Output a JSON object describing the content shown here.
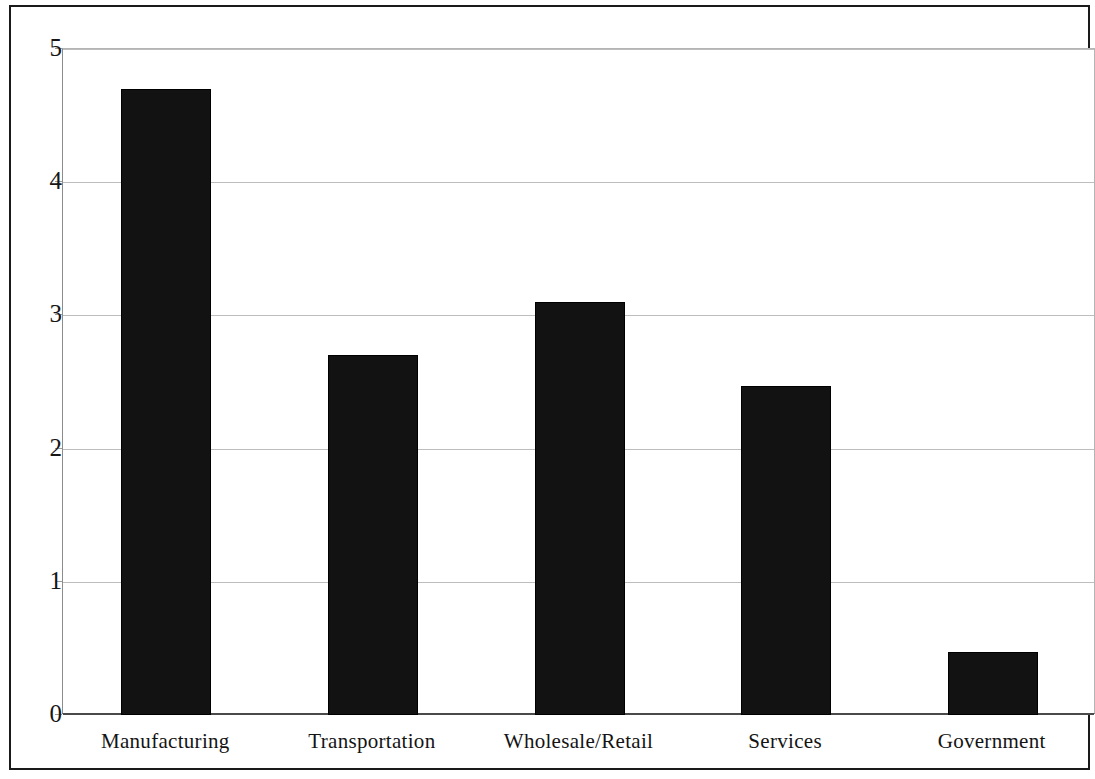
{
  "chart_data": {
    "type": "bar",
    "title": "",
    "subtitle": "",
    "xlabel": "",
    "ylabel": "",
    "categories": [
      "Manufacturing",
      "Transportation",
      "Wholesale/Retail",
      "Services",
      "Government"
    ],
    "values": [
      4.7,
      2.7,
      3.1,
      2.47,
      0.47
    ],
    "series": [
      {
        "name": "",
        "values": [
          4.7,
          2.7,
          3.1,
          2.47,
          0.47
        ]
      }
    ],
    "ylim": [
      0,
      5
    ],
    "ytick_labels": [
      "0",
      "1",
      "2",
      "3",
      "4",
      "5"
    ],
    "ytick_values": [
      0,
      1,
      2,
      3,
      4,
      5
    ],
    "grid": true,
    "grid_axis": "y",
    "legend": false,
    "legend_position": "none",
    "bar_color": "#121212",
    "gridline_color": "#bdbdbd",
    "axis_color": "#4a4a4a",
    "background_color": "#ffffff",
    "frame_color": "#1a1a1a"
  }
}
